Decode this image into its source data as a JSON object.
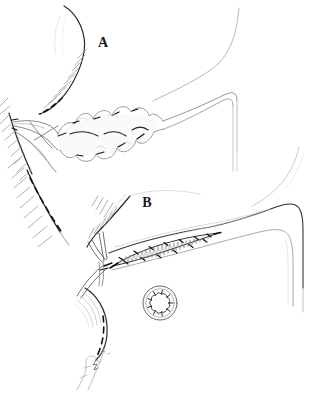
{
  "figure": {
    "background": "#ffffff",
    "ink": "#1a1a1a",
    "faint_ink": "#999999"
  },
  "panels": [
    {
      "id": "panel-a",
      "label": "A"
    },
    {
      "id": "panel-b",
      "label": "B"
    }
  ]
}
